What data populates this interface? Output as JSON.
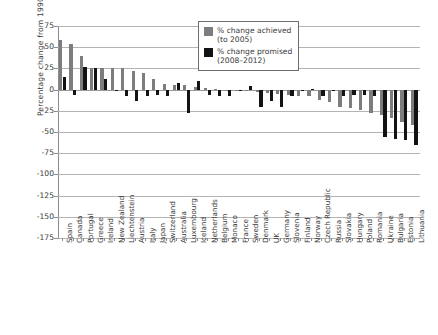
{
  "chart_data": {
    "type": "bar",
    "title": "",
    "subtitle": "",
    "xlabel": "",
    "ylabel": "Percentage change from 1990 values",
    "ylim": [
      -175,
      75
    ],
    "yticks": [
      75,
      50,
      25,
      0,
      -25,
      -50,
      -75,
      -100,
      -125,
      -150,
      -175
    ],
    "grid": true,
    "legend_position": "top-right",
    "legend": [
      {
        "label_line1": "% change achieved",
        "label_line2": "(to 2005)",
        "color": "#7d7d7d"
      },
      {
        "label_line1": "% change promised",
        "label_line2": "(2008–2012)",
        "color": "#131313"
      }
    ],
    "categories": [
      "Spain",
      "Canada",
      "Portugal",
      "Greece",
      "Ireland",
      "New Zealand",
      "Liechtenstein",
      "Austria",
      "Italy",
      "Japan",
      "Switzerland",
      "Australia",
      "Luxembourg",
      "Iceland",
      "Netherlands",
      "Belgium",
      "Monaco",
      "France",
      "Sweden",
      "Denmark",
      "UK",
      "Germany",
      "Slovenia",
      "Finland",
      "Norway",
      "Czech Republic",
      "Russia",
      "Slovakia",
      "Hungary",
      "Poland",
      "Romania",
      "Ukraine",
      "Bulgaria",
      "Estonia",
      "Lithuania"
    ],
    "series": [
      {
        "name": "% change achieved (to 2005)",
        "color": "#7d7d7d",
        "values": [
          59,
          54,
          40,
          26,
          25,
          25,
          25,
          22,
          19,
          13,
          7,
          6,
          5,
          3,
          2,
          1,
          0,
          -1,
          -2,
          -3,
          -4,
          -5,
          -6,
          -7,
          -8,
          -12,
          -15,
          -20,
          -22,
          -24,
          -28,
          -30,
          -33,
          -38,
          -42
        ]
      },
      {
        "name": "% change promised (2008–2012)",
        "color": "#131313",
        "values": [
          15,
          -6,
          27,
          25,
          13,
          0,
          -8,
          -13,
          -7,
          -6,
          -8,
          8,
          -28,
          10,
          -6,
          -8,
          -8,
          0,
          4,
          -21,
          -13,
          -21,
          -8,
          0,
          1,
          -8,
          0,
          -8,
          -6,
          -6,
          -8,
          -56,
          -58,
          -60,
          -65
        ]
      }
    ]
  }
}
